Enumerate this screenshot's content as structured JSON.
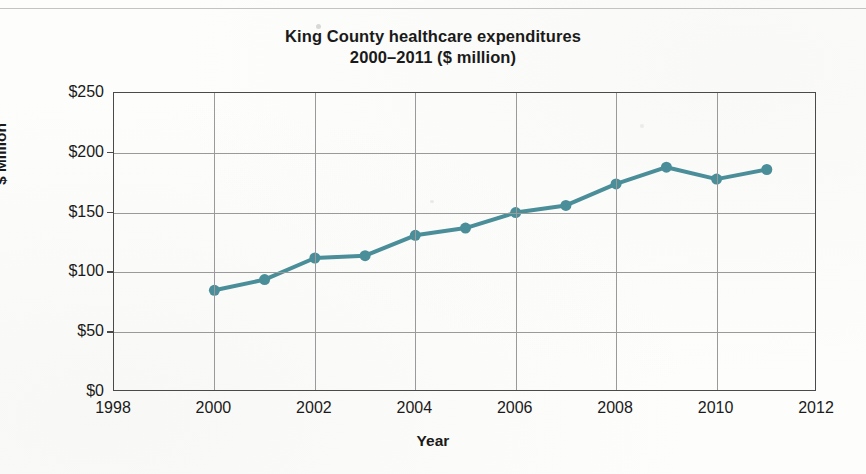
{
  "chart_data": {
    "type": "line",
    "title": "King County healthcare expenditures",
    "subtitle": "2000–2011 ($ million)",
    "xlabel": "Year",
    "ylabel": "$ Million",
    "x": [
      2000,
      2001,
      2002,
      2003,
      2004,
      2005,
      2006,
      2007,
      2008,
      2009,
      2010,
      2011
    ],
    "values": [
      85,
      94,
      112,
      114,
      131,
      137,
      150,
      156,
      174,
      188,
      178,
      186
    ],
    "xlim": [
      1998,
      2012
    ],
    "ylim": [
      0,
      250
    ],
    "xticks": [
      1998,
      2000,
      2002,
      2004,
      2006,
      2008,
      2010,
      2012
    ],
    "xtick_labels": [
      "1998",
      "2000",
      "2002",
      "2004",
      "2006",
      "2008",
      "2010",
      "2012"
    ],
    "yticks": [
      0,
      50,
      100,
      150,
      200,
      250
    ],
    "ytick_labels": [
      "$0",
      "$50",
      "$100",
      "$150",
      "$200",
      "$250"
    ],
    "grid": "both",
    "legend": "none",
    "series_color": "#4a8e99",
    "marker": "circle",
    "marker_size": 11,
    "line_width": 4
  },
  "axes": {
    "frame_color": "#4a4a4a",
    "grid_color": "#9a9a9a"
  },
  "page": {
    "background": "#fdfdfb"
  }
}
